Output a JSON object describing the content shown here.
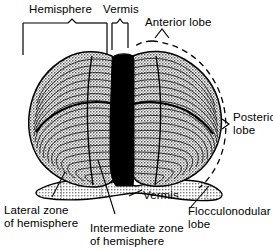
{
  "figure": {
    "background_color": "#ffffff",
    "ink_color": "#000000",
    "cortex_fill_color": "#b4b4b4",
    "vermis_fill_color": "#000000",
    "flocculonodular_fill_color": "#c8c8c8"
  },
  "labels": {
    "hemisphere": "Hemisphere",
    "vermis_top": "Vermis",
    "anterior_lobe": "Anterior lobe",
    "posterior_lobe_line1": "Posterior",
    "posterior_lobe_line2": "lobe",
    "vermis_bottom": "Vermis",
    "lateral_zone_line1": "Lateral zone",
    "lateral_zone_line2": "of hemisphere",
    "intermediate_zone_line1": "Intermediate zone",
    "intermediate_zone_line2": "of hemisphere",
    "flocculonodular_line1": "Flocculonodular",
    "flocculonodular_line2": "lobe"
  }
}
